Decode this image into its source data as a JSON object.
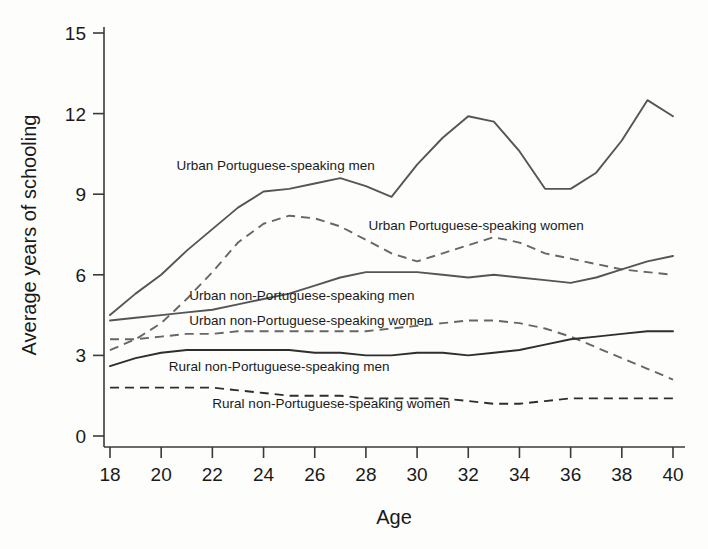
{
  "chart_data": {
    "type": "line",
    "title": "",
    "xlabel": "Age",
    "ylabel": "Average years of schooling",
    "xlim": [
      18,
      40
    ],
    "ylim": [
      0,
      15
    ],
    "xticks": [
      18,
      20,
      22,
      24,
      26,
      28,
      30,
      32,
      34,
      36,
      38,
      40
    ],
    "yticks": [
      0,
      3,
      6,
      9,
      12,
      15
    ],
    "grid": false,
    "legend_position": "inline-labels",
    "x": [
      18,
      19,
      20,
      21,
      22,
      23,
      24,
      25,
      26,
      27,
      28,
      29,
      30,
      31,
      32,
      33,
      34,
      35,
      36,
      37,
      38,
      39,
      40
    ],
    "series": [
      {
        "name": "Urban Portuguese-speaking men",
        "style": "solid",
        "color": "#555555",
        "values": [
          4.5,
          5.3,
          6.0,
          6.9,
          7.7,
          8.5,
          9.1,
          9.2,
          9.4,
          9.6,
          9.3,
          8.9,
          10.1,
          11.1,
          11.9,
          11.7,
          10.6,
          9.2,
          9.2,
          9.8,
          11.0,
          12.5,
          11.9
        ]
      },
      {
        "name": "Urban Portuguese-speaking women",
        "style": "dashed",
        "color": "#666666",
        "values": [
          3.2,
          3.6,
          4.2,
          5.1,
          6.1,
          7.2,
          7.9,
          8.2,
          8.1,
          7.8,
          7.3,
          6.8,
          6.5,
          6.8,
          7.1,
          7.4,
          7.2,
          6.8,
          6.6,
          6.4,
          6.2,
          6.1,
          6.0
        ]
      },
      {
        "name": "Urban non-Portuguese-speaking men",
        "style": "solid",
        "color": "#555555",
        "values": [
          4.3,
          4.4,
          4.5,
          4.6,
          4.7,
          4.9,
          5.1,
          5.3,
          5.6,
          5.9,
          6.1,
          6.1,
          6.1,
          6.0,
          5.9,
          6.0,
          5.9,
          5.8,
          5.7,
          5.9,
          6.2,
          6.5,
          6.7
        ]
      },
      {
        "name": "Urban non-Portuguese-speaking women",
        "style": "dashed",
        "color": "#666666",
        "values": [
          3.6,
          3.6,
          3.7,
          3.8,
          3.8,
          3.9,
          3.9,
          3.9,
          3.9,
          3.9,
          3.9,
          4.0,
          4.1,
          4.2,
          4.3,
          4.3,
          4.2,
          4.0,
          3.7,
          3.3,
          2.9,
          2.5,
          2.1
        ]
      },
      {
        "name": "Rural non-Portuguese-speaking men",
        "style": "solid",
        "color": "#2e2e2e",
        "values": [
          2.6,
          2.9,
          3.1,
          3.2,
          3.2,
          3.2,
          3.2,
          3.2,
          3.1,
          3.1,
          3.0,
          3.0,
          3.1,
          3.1,
          3.0,
          3.1,
          3.2,
          3.4,
          3.6,
          3.7,
          3.8,
          3.9,
          3.9
        ]
      },
      {
        "name": "Rural non-Portuguese-speaking women",
        "style": "dashed",
        "color": "#2e2e2e",
        "values": [
          1.8,
          1.8,
          1.8,
          1.8,
          1.8,
          1.7,
          1.6,
          1.5,
          1.5,
          1.5,
          1.4,
          1.4,
          1.4,
          1.4,
          1.3,
          1.2,
          1.2,
          1.3,
          1.4,
          1.4,
          1.4,
          1.4,
          1.4
        ]
      }
    ],
    "annotations": [
      {
        "text": "Urban Portuguese-speaking men",
        "x": 20.6,
        "y": 10.1
      },
      {
        "text": "Urban Portuguese-speaking women",
        "x": 28.1,
        "y": 7.85
      },
      {
        "text": "Urban non-Portuguese-speaking men",
        "x": 21.1,
        "y": 5.25
      },
      {
        "text": "Urban non-Portuguese-speaking women",
        "x": 21.1,
        "y": 4.32
      },
      {
        "text": "Rural non-Portuguese-speaking men",
        "x": 20.3,
        "y": 2.62
      },
      {
        "text": "Rural non-Portuguese-speaking women",
        "x": 22.0,
        "y": 1.22
      }
    ]
  }
}
